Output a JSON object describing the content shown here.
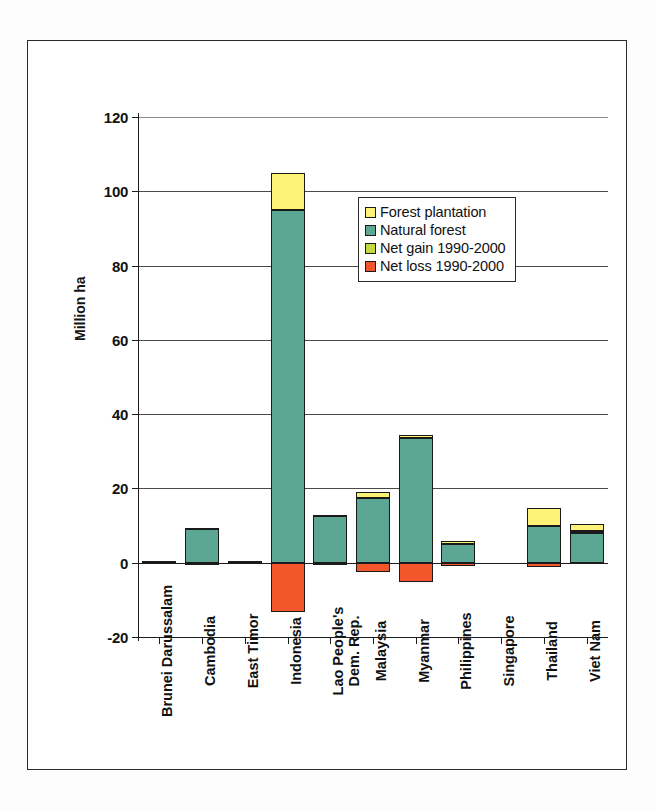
{
  "chart_data": {
    "type": "bar",
    "title": "",
    "subtitle": "",
    "xlabel": "",
    "ylabel": "Million ha",
    "ylim": [
      -20,
      120
    ],
    "ytick_values": [
      -20,
      0,
      20,
      40,
      60,
      80,
      100,
      120
    ],
    "ytick_labels": [
      "-20",
      "0",
      "20",
      "40",
      "60",
      "80",
      "100",
      "120"
    ],
    "grid": true,
    "grid_axis": "y",
    "stacked": true,
    "legend_position": "upper center",
    "categories": [
      "Brunei Darussalam",
      "Cambodia",
      "East Timor",
      "Indonesia",
      "Lao People's Dem. Rep.",
      "Malaysia",
      "Myanmar",
      "Philippines",
      "Singapore",
      "Thailand",
      "Viet Nam"
    ],
    "series": [
      {
        "name": "Forest plantation",
        "color": "#FCF376",
        "values": [
          0.0,
          0.1,
          0.0,
          9.9,
          0.2,
          1.8,
          0.8,
          0.8,
          0.0,
          4.9,
          1.7
        ]
      },
      {
        "name": "Natural forest",
        "color": "#5CA793",
        "values": [
          0.4,
          9.2,
          0.5,
          95.0,
          12.6,
          17.3,
          33.6,
          5.0,
          0.0,
          9.9,
          8.1
        ]
      },
      {
        "name": "Net gain 1990-2000",
        "color": "#C4D840",
        "values": [
          0.0,
          0.0,
          0.0,
          0.0,
          0.0,
          0.0,
          0.0,
          0.0,
          0.0,
          0.0,
          0.5
        ]
      },
      {
        "name": "Net loss 1990-2000",
        "color": "#F3562A",
        "values": [
          0.0,
          -0.6,
          0.0,
          -13.3,
          -0.5,
          -2.4,
          -5.2,
          -0.9,
          0.0,
          -1.1,
          0.0
        ]
      }
    ]
  },
  "legend": {
    "items": [
      {
        "label": "Forest plantation",
        "color": "#FCF376"
      },
      {
        "label": "Natural forest",
        "color": "#5CA793"
      },
      {
        "label": "Net gain 1990-2000",
        "color": "#C4D840"
      },
      {
        "label": "Net loss 1990-2000",
        "color": "#F3562A"
      }
    ]
  }
}
